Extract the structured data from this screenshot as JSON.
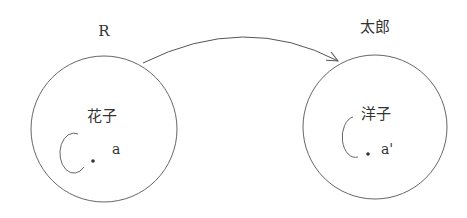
{
  "diagram": {
    "left": {
      "outer_label": "R",
      "inner_label": "花子",
      "point_label": "a"
    },
    "right": {
      "outer_label": "太郎",
      "inner_label": "洋子",
      "point_label": "a'"
    },
    "colors": {
      "stroke": "#555555",
      "text": "#333333",
      "background": "#ffffff"
    }
  }
}
